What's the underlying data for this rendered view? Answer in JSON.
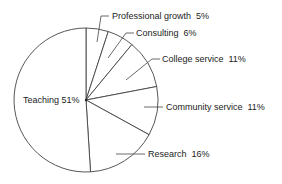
{
  "chart_data": {
    "type": "pie",
    "title": "",
    "start_angle_deg": 0,
    "direction": "clockwise",
    "categories": [
      "Professional growth",
      "Consulting",
      "College service",
      "Community service",
      "Research",
      "Teaching"
    ],
    "values": [
      5,
      6,
      11,
      11,
      16,
      51
    ],
    "unit": "%",
    "labels": [
      {
        "name": "Professional growth",
        "text": "Professional growth  5%"
      },
      {
        "name": "Consulting",
        "text": "Consulting  6%"
      },
      {
        "name": "College service",
        "text": "College service  11%"
      },
      {
        "name": "Community service",
        "text": "Community service  11%"
      },
      {
        "name": "Research",
        "text": "Research  16%"
      },
      {
        "name": "Teaching",
        "text": "Teaching 51%"
      }
    ],
    "legend": "none (labels with leader lines)",
    "colors": {
      "fill": "#ffffff",
      "stroke": "#444444",
      "text": "#222222"
    }
  }
}
